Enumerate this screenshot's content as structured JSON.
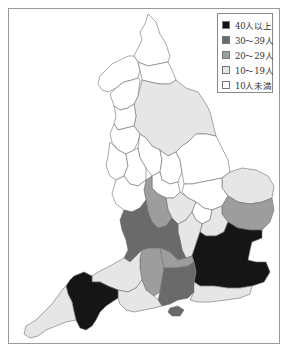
{
  "map": {
    "title": "",
    "region": "England (counties)",
    "colors": {
      "c40plus": "#151515",
      "c30_39": "#6a6a6a",
      "c20_29": "#9d9d9d",
      "c10_19": "#e6e6e6",
      "cUnder10": "#ffffff",
      "border": "#6e6e6e"
    }
  },
  "legend": {
    "items": [
      {
        "label": "40人以上",
        "color": "#151515"
      },
      {
        "label": "30～39人",
        "color": "#6a6a6a"
      },
      {
        "label": "20～29人",
        "color": "#9d9d9d"
      },
      {
        "label": "10～19人",
        "color": "#e6e6e6"
      },
      {
        "label": "10人未満",
        "color": "#ffffff"
      }
    ]
  }
}
